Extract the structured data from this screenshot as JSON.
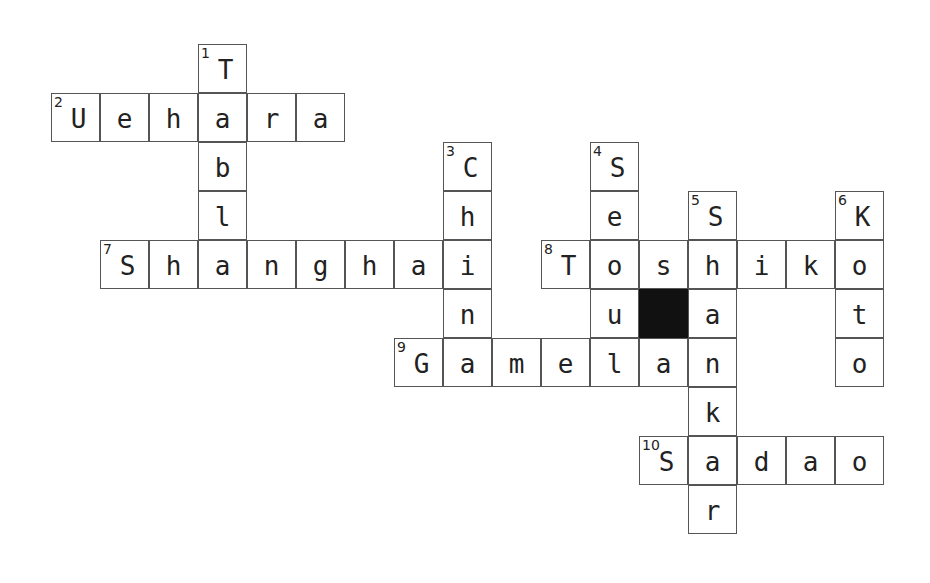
{
  "puzzle": {
    "cell_size": 49,
    "origin_x": 52,
    "origin_y": 45,
    "block_color": "#111111",
    "border_color": "#555555"
  },
  "entries": [
    {
      "number": 1,
      "direction": "down",
      "answer": "Tabla",
      "row": 0,
      "col": 3
    },
    {
      "number": 2,
      "direction": "across",
      "answer": "Uehara",
      "row": 1,
      "col": 0
    },
    {
      "number": 3,
      "direction": "down",
      "answer": "China",
      "row": 2,
      "col": 8
    },
    {
      "number": 4,
      "direction": "down",
      "answer": "Seoul",
      "row": 2,
      "col": 11
    },
    {
      "number": 5,
      "direction": "down",
      "answer": "Shankar",
      "row": 3,
      "col": 13
    },
    {
      "number": 6,
      "direction": "down",
      "answer": "Koto",
      "row": 3,
      "col": 16
    },
    {
      "number": 7,
      "direction": "across",
      "answer": "Shanghai",
      "row": 4,
      "col": 1
    },
    {
      "number": 8,
      "direction": "across",
      "answer": "Toshiko",
      "row": 4,
      "col": 10
    },
    {
      "number": 9,
      "direction": "across",
      "answer": "Gamelan",
      "row": 6,
      "col": 7
    },
    {
      "number": 10,
      "direction": "across",
      "answer": "Sadao",
      "row": 8,
      "col": 12
    }
  ],
  "blocks": [
    {
      "row": 5,
      "col": 12
    }
  ]
}
